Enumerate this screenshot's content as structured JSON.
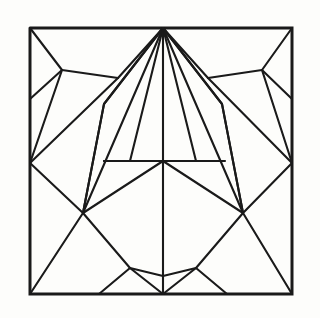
{
  "figure": {
    "kind": "origami-crease-pattern",
    "title": "",
    "caption": "",
    "background_color": "#fdfdfb",
    "line_color": "#1a1a1a",
    "border_color": "#1a1a1a",
    "line_width": 2.1,
    "border_width": 3.0,
    "canvas": {
      "width": 320,
      "height": 318
    },
    "square": {
      "left": 30,
      "top": 28,
      "right": 292,
      "bottom": 294
    },
    "symmetry": "bilateral-vertical",
    "nodes": {
      "top_apex": [
        163,
        28
      ],
      "bottom_apex": [
        163,
        294
      ],
      "center": [
        163,
        161
      ],
      "left_edge_node": [
        30,
        163
      ],
      "right_edge_node": [
        292,
        163
      ],
      "left_y_junction": [
        62,
        70
      ],
      "right_y_junction": [
        262,
        70
      ],
      "left_low_node": [
        83,
        213
      ],
      "right_low_node": [
        243,
        213
      ],
      "left_bottom_node": [
        130,
        268
      ],
      "right_bottom_node": [
        196,
        268
      ],
      "bottom_dip": [
        163,
        276
      ],
      "left_upper_bend": [
        118,
        78
      ],
      "right_upper_bend": [
        208,
        78
      ],
      "left_mid_bend": [
        104,
        104
      ],
      "right_mid_bend": [
        222,
        104
      ]
    },
    "segments": [
      {
        "name": "border-square",
        "points": [
          [
            30,
            28
          ],
          [
            292,
            28
          ],
          [
            292,
            294
          ],
          [
            30,
            294
          ],
          [
            30,
            28
          ]
        ],
        "weight": "border"
      },
      {
        "name": "fan-left-1-to-left-edge-node",
        "points": [
          [
            163,
            28
          ],
          [
            118,
            78
          ],
          [
            30,
            163
          ]
        ],
        "weight": "line"
      },
      {
        "name": "fan-left-2-to-left-low-node",
        "points": [
          [
            163,
            28
          ],
          [
            104,
            104
          ],
          [
            83,
            213
          ]
        ],
        "weight": "line"
      },
      {
        "name": "fan-left-3-to-center",
        "points": [
          [
            163,
            28
          ],
          [
            104,
            104
          ]
        ],
        "weight": "line"
      },
      {
        "name": "fan-left-steep-to-left-low",
        "points": [
          [
            163,
            28
          ],
          [
            83,
            213
          ]
        ],
        "weight": "line"
      },
      {
        "name": "fan-left-inner-to-center",
        "points": [
          [
            163,
            28
          ],
          [
            130,
            161
          ]
        ],
        "weight": "line"
      },
      {
        "name": "vertical-axis-upper",
        "points": [
          [
            163,
            28
          ],
          [
            163,
            161
          ]
        ],
        "weight": "line"
      },
      {
        "name": "vertical-axis-lower",
        "points": [
          [
            163,
            161
          ],
          [
            163,
            294
          ]
        ],
        "weight": "line"
      },
      {
        "name": "fan-right-inner-to-center",
        "points": [
          [
            163,
            28
          ],
          [
            196,
            161
          ]
        ],
        "weight": "line"
      },
      {
        "name": "fan-right-steep-to-right-low",
        "points": [
          [
            163,
            28
          ],
          [
            243,
            213
          ]
        ],
        "weight": "line"
      },
      {
        "name": "fan-right-3",
        "points": [
          [
            163,
            28
          ],
          [
            222,
            104
          ]
        ],
        "weight": "line"
      },
      {
        "name": "fan-right-2-to-right-low-node",
        "points": [
          [
            163,
            28
          ],
          [
            222,
            104
          ],
          [
            243,
            213
          ]
        ],
        "weight": "line"
      },
      {
        "name": "fan-right-1-to-right-edge-node",
        "points": [
          [
            163,
            28
          ],
          [
            208,
            78
          ],
          [
            292,
            163
          ]
        ],
        "weight": "line"
      },
      {
        "name": "left-y-stem-to-corner",
        "points": [
          [
            62,
            70
          ],
          [
            30,
            28
          ]
        ],
        "weight": "line"
      },
      {
        "name": "left-y-stem-to-edge",
        "points": [
          [
            62,
            70
          ],
          [
            30,
            99
          ]
        ],
        "weight": "line"
      },
      {
        "name": "left-y-stem-to-bend",
        "points": [
          [
            62,
            70
          ],
          [
            118,
            78
          ]
        ],
        "weight": "line"
      },
      {
        "name": "left-y-stem-down-to-left-edge-node",
        "points": [
          [
            62,
            70
          ],
          [
            30,
            163
          ]
        ],
        "weight": "line"
      },
      {
        "name": "right-y-stem-to-corner",
        "points": [
          [
            262,
            70
          ],
          [
            292,
            28
          ]
        ],
        "weight": "line"
      },
      {
        "name": "right-y-stem-to-edge",
        "points": [
          [
            262,
            70
          ],
          [
            292,
            99
          ]
        ],
        "weight": "line"
      },
      {
        "name": "right-y-stem-to-bend",
        "points": [
          [
            262,
            70
          ],
          [
            208,
            78
          ]
        ],
        "weight": "line"
      },
      {
        "name": "right-y-stem-down-to-right-edge-node",
        "points": [
          [
            262,
            70
          ],
          [
            292,
            163
          ]
        ],
        "weight": "line"
      },
      {
        "name": "left-edge-node-to-left-low-node",
        "points": [
          [
            30,
            163
          ],
          [
            83,
            213
          ]
        ],
        "weight": "line"
      },
      {
        "name": "right-edge-node-to-right-low-node",
        "points": [
          [
            292,
            163
          ],
          [
            243,
            213
          ]
        ],
        "weight": "line"
      },
      {
        "name": "horizontal-mid",
        "points": [
          [
            104,
            161
          ],
          [
            225,
            161
          ]
        ],
        "weight": "line"
      },
      {
        "name": "center-diag-left-up",
        "points": [
          [
            163,
            161
          ],
          [
            104,
            161
          ]
        ],
        "weight": "line"
      },
      {
        "name": "center-diag-left-down",
        "points": [
          [
            163,
            161
          ],
          [
            83,
            213
          ]
        ],
        "weight": "line"
      },
      {
        "name": "center-diag-right-down",
        "points": [
          [
            163,
            161
          ],
          [
            243,
            213
          ]
        ],
        "weight": "line"
      },
      {
        "name": "left-low-to-left-bottom-node",
        "points": [
          [
            83,
            213
          ],
          [
            130,
            268
          ]
        ],
        "weight": "line"
      },
      {
        "name": "right-low-to-right-bottom-node",
        "points": [
          [
            243,
            213
          ],
          [
            196,
            268
          ]
        ],
        "weight": "line"
      },
      {
        "name": "left-low-to-bottom-left-corner",
        "points": [
          [
            83,
            213
          ],
          [
            30,
            294
          ]
        ],
        "weight": "line"
      },
      {
        "name": "right-low-to-bottom-right-corner",
        "points": [
          [
            243,
            213
          ],
          [
            292,
            294
          ]
        ],
        "weight": "line"
      },
      {
        "name": "left-bottom-node-to-bottom-edge",
        "points": [
          [
            130,
            268
          ],
          [
            99,
            294
          ]
        ],
        "weight": "line"
      },
      {
        "name": "right-bottom-node-to-bottom-edge",
        "points": [
          [
            196,
            268
          ],
          [
            227,
            294
          ]
        ],
        "weight": "line"
      },
      {
        "name": "left-bottom-node-to-bottom-apex",
        "points": [
          [
            130,
            268
          ],
          [
            163,
            294
          ]
        ],
        "weight": "line"
      },
      {
        "name": "right-bottom-node-to-bottom-apex",
        "points": [
          [
            196,
            268
          ],
          [
            163,
            294
          ]
        ],
        "weight": "line"
      },
      {
        "name": "bottom-dip-arc",
        "points": [
          [
            130,
            268
          ],
          [
            163,
            276
          ],
          [
            196,
            268
          ]
        ],
        "weight": "line"
      },
      {
        "name": "left-low-node-up-to-fan",
        "points": [
          [
            83,
            213
          ],
          [
            104,
            104
          ]
        ],
        "weight": "line"
      },
      {
        "name": "right-low-node-up-to-fan",
        "points": [
          [
            243,
            213
          ],
          [
            222,
            104
          ]
        ],
        "weight": "line"
      }
    ]
  }
}
